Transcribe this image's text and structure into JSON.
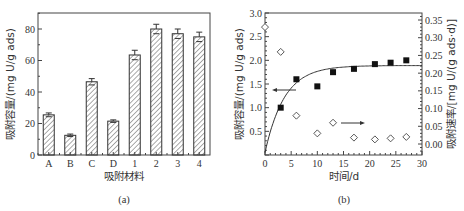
{
  "chart_data": [
    {
      "type": "bar",
      "caption": "(a)",
      "title": "",
      "xlabel": "吸附材料",
      "ylabel": "吸附容量/(mg U/g ads)",
      "categories": [
        "A",
        "B",
        "C",
        "D",
        "1",
        "2",
        "3",
        "4"
      ],
      "values": [
        25.5,
        12.5,
        46.5,
        21.5,
        63.5,
        80,
        77,
        75
      ],
      "error": [
        1.2,
        0.8,
        2.0,
        0.8,
        3.0,
        3.0,
        3.0,
        3.0
      ],
      "ylim": [
        0,
        90
      ],
      "yticks": [
        0,
        20,
        40,
        60,
        80
      ],
      "style": "hatched",
      "grid": false
    },
    {
      "type": "scatter",
      "caption": "(b)",
      "title": "",
      "xlabel": "时间/d",
      "ylabel": "吸附容量/(mg U/g ads)",
      "y2label": "吸附速率/[mg U/(g ads·d)]",
      "xlim": [
        0,
        30
      ],
      "xticks": [
        0,
        5,
        10,
        15,
        20,
        25,
        30
      ],
      "ylim": [
        0,
        3.0
      ],
      "yticks": [
        0.5,
        1.0,
        1.5,
        2.0,
        2.5,
        3.0
      ],
      "y2lim": [
        -0.03,
        0.37
      ],
      "y2ticks": [
        0.0,
        0.05,
        0.1,
        0.15,
        0.2,
        0.25,
        0.3,
        0.35
      ],
      "series": [
        {
          "name": "吸附容量",
          "axis": "left",
          "marker": "filled-square",
          "x": [
            3,
            6,
            10,
            13,
            17,
            21,
            24,
            27
          ],
          "y": [
            1.0,
            1.6,
            1.45,
            1.75,
            1.82,
            1.92,
            1.95,
            2.0
          ]
        },
        {
          "name": "吸附容量拟合曲线",
          "axis": "left",
          "marker": "line",
          "x": [
            0,
            2,
            4,
            6,
            8,
            10,
            12,
            15,
            20,
            25,
            30
          ],
          "y": [
            0.05,
            0.72,
            1.19,
            1.48,
            1.66,
            1.76,
            1.82,
            1.86,
            1.88,
            1.89,
            1.89
          ]
        },
        {
          "name": "吸附速率",
          "axis": "right",
          "marker": "open-diamond",
          "x": [
            0,
            3,
            6,
            10,
            13,
            17,
            21,
            24,
            27
          ],
          "y": [
            0.33,
            0.26,
            0.08,
            0.03,
            0.06,
            0.018,
            0.013,
            0.016,
            0.02
          ]
        }
      ],
      "annotations": [
        {
          "type": "arrow",
          "direction": "left",
          "meaning": "left axis applies to squares"
        },
        {
          "type": "arrow",
          "direction": "right",
          "meaning": "right axis applies to diamonds"
        }
      ],
      "grid": false
    }
  ]
}
